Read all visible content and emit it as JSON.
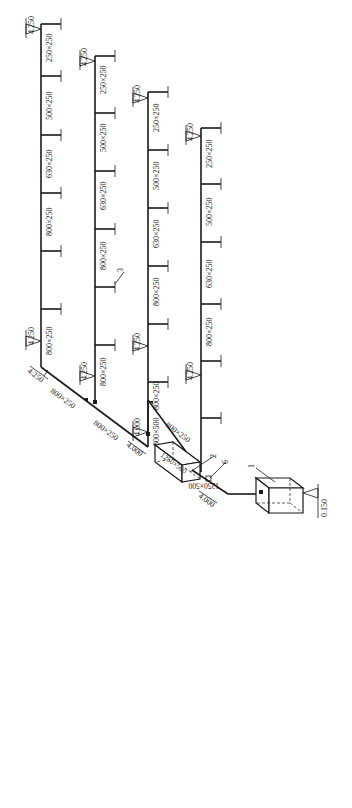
{
  "diagram": {
    "type": "HVAC duct isometric system diagram",
    "stroke_color": "#1a1a1a",
    "background": "#ffffff",
    "branches": [
      {
        "id": "branch-1",
        "end_elevation": "4.250",
        "start_elevation": "4.250",
        "segments": [
          "250×250",
          "500×250",
          "630×250",
          "800×250",
          "800×250"
        ]
      },
      {
        "id": "branch-2",
        "end_elevation": "4.250",
        "start_elevation": "4.250",
        "segments": [
          "250×250",
          "500×250",
          "630×250",
          "800×250",
          "800×250"
        ],
        "callout": "3"
      },
      {
        "id": "branch-3",
        "end_elevation": "4.250",
        "start_elevation": "4.250",
        "segments": [
          "250×250",
          "500×250",
          "630×250",
          "800×250",
          "800×250"
        ]
      },
      {
        "id": "branch-4",
        "end_elevation": "4.250",
        "start_elevation": "4.250",
        "segments": [
          "250×250",
          "500×250",
          "630×250",
          "800×250"
        ]
      }
    ],
    "main_duct": {
      "upper_label": "800×250",
      "lower_label": "800×250",
      "top_elevation": "4.250",
      "riser_label": "800×500",
      "riser_elevation": "4.000",
      "branch4_feed_label": "800×250",
      "junction_elevation": "4.000"
    },
    "equipment": {
      "unit_1_callout": "1",
      "unit_2_callout": "2",
      "damper_callout": "6",
      "unit_2_duct": "1250×500",
      "connection_duct": "1250×500",
      "connection_elevation": "4.000",
      "base_elevation": "0.150"
    }
  }
}
